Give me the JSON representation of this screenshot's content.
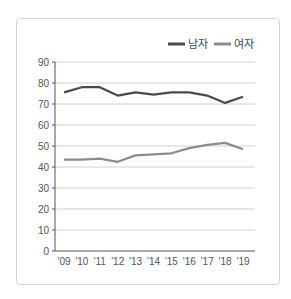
{
  "chart_data": {
    "type": "line",
    "title": "",
    "xlabel": "",
    "ylabel": "",
    "categories": [
      "'09",
      "'10",
      "'11",
      "'12",
      "'13",
      "'14",
      "'15",
      "'16",
      "'17",
      "'18",
      "'19"
    ],
    "series": [
      {
        "name": "남자",
        "color": "#4a4a4a",
        "values": [
          75.5,
          78,
          78,
          74,
          75.5,
          74.5,
          75.5,
          75.5,
          74,
          70.5,
          73.5
        ]
      },
      {
        "name": "여자",
        "color": "#8c8c8c",
        "values": [
          43.5,
          43.5,
          44,
          42.5,
          45.5,
          46,
          46.5,
          49,
          50.5,
          51.5,
          48.5
        ]
      }
    ],
    "ylim": [
      0,
      90
    ],
    "yticks": [
      0,
      10,
      20,
      30,
      40,
      50,
      60,
      70,
      80,
      90
    ],
    "grid": true,
    "legend_position": "top-right"
  },
  "legend": {
    "male_label": "남자",
    "female_label": "여자"
  }
}
